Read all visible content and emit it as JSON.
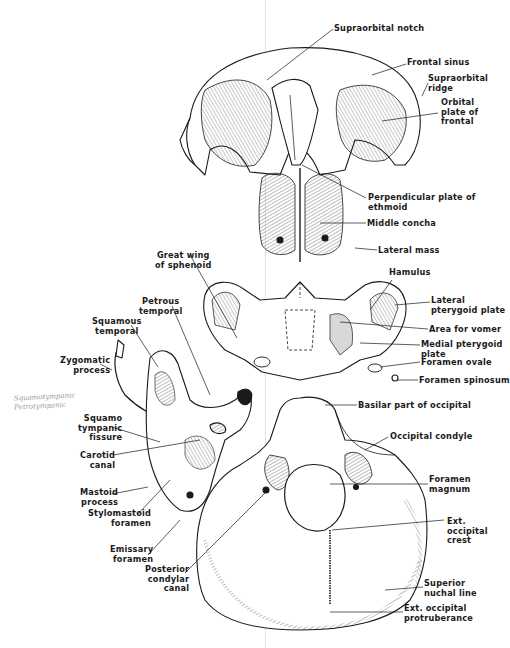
{
  "figure": {
    "parts": [
      "frontal",
      "ethmoid",
      "sphenoid",
      "temporal",
      "occipital"
    ]
  },
  "labels": {
    "supraorbital_notch": "Supraorbital notch",
    "frontal_sinus": "Frontal sinus",
    "supraorbital_ridge": "Supraorbital\nridge",
    "orbital_plate": "Orbital\nplate of\nfrontal",
    "perpendicular_plate": "Perpendicular plate of\nethmoid",
    "middle_concha": "Middle concha",
    "lateral_mass": "Lateral mass",
    "great_wing": "Great wing\nof sphenoid",
    "hamulus": "Hamulus",
    "lateral_pterygoid": "Lateral\npterygoid plate",
    "area_vomer": "Area for vomer",
    "medial_pterygoid": "Medial pterygoid\nplate",
    "foramen_ovale": "Foramen ovale",
    "foramen_spinosum": "Foramen spinosum",
    "petrous_temporal": "Petrous\ntemporal",
    "squamous_temporal": "Squamous\ntemporal",
    "zygomatic_process": "Zygomatic\nprocess",
    "squamotympanic_fissure": "Squamo\ntympanic\nfissure",
    "carotid_canal": "Carotid\ncanal",
    "mastoid_process": "Mastoid\nprocess",
    "stylomastoid_foramen": "Stylomastoid\nforamen",
    "emissary_foramen": "Emissary\nforamen",
    "posterior_condylar": "Posterior\ncondylar\ncanal",
    "basilar_part": "Basilar part of occipital",
    "occipital_condyle": "Occipital condyle",
    "foramen_magnum": "Foramen\nmagnum",
    "ext_occipital_crest": "Ext.\noccipital\ncrest",
    "superior_nuchal": "Superior\nnuchal line",
    "ext_occipital_protuberance": "Ext. occipital\nprotruberance"
  },
  "handwritten_note": "Squamotympanic\nPetrotympanic",
  "colors": {
    "ink": "#1a1a1a",
    "paper": "#ffffff",
    "pencil": "#9a9a9a",
    "fold": "#e3e3e3"
  }
}
